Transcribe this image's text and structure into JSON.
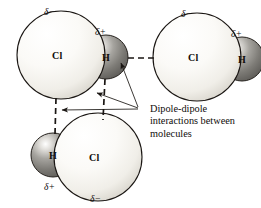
{
  "figure": {
    "type": "molecular-interaction-diagram",
    "background_color": "#ffffff",
    "line_color": "#1a1613",
    "caption": {
      "lines": [
        "Dipole-dipole",
        "interactions between",
        "molecules"
      ],
      "full_text": "Dipole-dipole interactions between molecules"
    },
    "molecules": [
      {
        "id": "hcl-top-left",
        "atoms": [
          {
            "element": "Cl",
            "label": "Cl",
            "charge_label": "δ−",
            "charge_position": "above",
            "cx": 61,
            "cy": 55,
            "r": 44,
            "fill": "#f7f6f2",
            "kind": "large-light"
          },
          {
            "element": "H",
            "label": "H",
            "charge_label": "δ+",
            "charge_position": "above",
            "cx": 106,
            "cy": 57,
            "r": 22,
            "fill": "#8f8d88",
            "kind": "small-dark"
          }
        ]
      },
      {
        "id": "hcl-top-right",
        "atoms": [
          {
            "element": "Cl",
            "label": "Cl",
            "charge_label": "δ−",
            "charge_position": "above",
            "cx": 197,
            "cy": 57,
            "r": 44,
            "fill": "#f7f6f2",
            "kind": "large-light"
          },
          {
            "element": "H",
            "label": "H",
            "charge_label": "δ+",
            "charge_position": "above",
            "cx": 242,
            "cy": 59,
            "r": 22,
            "fill": "#8f8d88",
            "kind": "small-dark"
          }
        ]
      },
      {
        "id": "hcl-bottom",
        "atoms": [
          {
            "element": "H",
            "label": "H",
            "charge_label": "δ+",
            "charge_position": "below",
            "cx": 53,
            "cy": 155,
            "r": 22,
            "fill": "#8f8d88",
            "kind": "small-dark"
          },
          {
            "element": "Cl",
            "label": "Cl",
            "charge_label": "δ−",
            "charge_position": "below",
            "cx": 98,
            "cy": 157,
            "r": 44,
            "fill": "#f7f6f2",
            "kind": "large-light"
          }
        ]
      }
    ],
    "interactions": [
      {
        "id": "bond-horizontal",
        "style": "dashed",
        "from": "hcl-top-left.H",
        "to": "hcl-top-right.Cl",
        "x1": 128,
        "y1": 58,
        "x2": 156,
        "y2": 58
      },
      {
        "id": "bond-vertical-left",
        "style": "dashed",
        "from": "hcl-top-left.Cl",
        "to": "hcl-bottom.H",
        "x1": 56,
        "y1": 99,
        "x2": 55,
        "y2": 133
      },
      {
        "id": "bond-vertical-middle",
        "style": "dashed",
        "from": "hcl-top-left.H",
        "to": "hcl-bottom.Cl",
        "x1": 105,
        "y1": 79,
        "x2": 103,
        "y2": 119
      }
    ],
    "leader_lines": {
      "vertex_x": 138,
      "vertex_y": 108,
      "targets": [
        {
          "target": "bond-horizontal",
          "tip_x": 121,
          "tip_y": 64
        },
        {
          "target": "bond-vertical-middle",
          "tip_x": 96,
          "tip_y": 94
        },
        {
          "target": "bond-vertical-left",
          "tip_x": 61,
          "tip_y": 110
        }
      ]
    }
  }
}
